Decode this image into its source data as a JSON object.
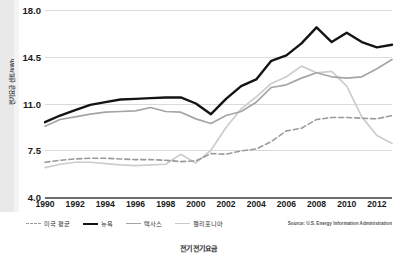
{
  "chart_data": {
    "type": "line",
    "title": "",
    "xlabel": "",
    "ylabel": "전기요금 센트/kWh",
    "ylim": [
      4.0,
      18.0
    ],
    "xlim": [
      1990,
      2013
    ],
    "yticks": [
      "18.0",
      "14.5",
      "11.0",
      "7.5",
      "4.0"
    ],
    "ytick_values": [
      18.0,
      14.5,
      11.0,
      7.5,
      4.0
    ],
    "xticks": [
      "1990",
      "1992",
      "1994",
      "1996",
      "1998",
      "2000",
      "2002",
      "2004",
      "2006",
      "2008",
      "2010",
      "2012"
    ],
    "xtick_values": [
      1990,
      1992,
      1994,
      1996,
      1998,
      2000,
      2002,
      2004,
      2006,
      2008,
      2010,
      2012
    ],
    "x": [
      1990,
      1991,
      1992,
      1993,
      1994,
      1995,
      1996,
      1997,
      1998,
      1999,
      2000,
      2001,
      2002,
      2003,
      2004,
      2005,
      2006,
      2007,
      2008,
      2009,
      2010,
      2011,
      2012,
      2013
    ],
    "grid": true,
    "legend_position": "bottom",
    "series": [
      {
        "name": "미국 평균",
        "style": "dashed",
        "color": "#9a9a9a",
        "width": 1.6,
        "values": [
          6.6,
          6.75,
          6.85,
          6.9,
          6.9,
          6.85,
          6.8,
          6.8,
          6.75,
          6.65,
          6.7,
          7.25,
          7.2,
          7.45,
          7.6,
          8.15,
          8.95,
          9.15,
          9.8,
          9.95,
          9.95,
          9.9,
          9.85,
          10.1
        ]
      },
      {
        "name": "뉴욕",
        "style": "solid",
        "color": "#141414",
        "width": 2.4,
        "values": [
          9.6,
          10.1,
          10.5,
          10.9,
          11.1,
          11.3,
          11.35,
          11.4,
          11.45,
          11.45,
          11.0,
          10.2,
          11.35,
          12.3,
          12.8,
          14.2,
          14.6,
          15.5,
          16.7,
          15.6,
          16.3,
          15.6,
          15.2,
          15.4
        ]
      },
      {
        "name": "텍사스",
        "style": "solid",
        "color": "#a5a5a5",
        "width": 1.7,
        "values": [
          9.3,
          9.8,
          10.0,
          10.2,
          10.35,
          10.4,
          10.45,
          10.7,
          10.4,
          10.35,
          9.85,
          9.5,
          10.1,
          10.4,
          11.1,
          12.2,
          12.4,
          12.9,
          13.3,
          13.0,
          12.9,
          13.0,
          13.6,
          14.3
        ]
      },
      {
        "name": "캘리포니아",
        "style": "solid",
        "color": "#cdcdcd",
        "width": 1.7,
        "values": [
          6.2,
          6.45,
          6.6,
          6.6,
          6.5,
          6.4,
          6.35,
          6.4,
          6.45,
          7.2,
          6.55,
          7.5,
          9.2,
          10.6,
          11.5,
          12.5,
          13.0,
          13.8,
          13.3,
          13.4,
          12.3,
          10.0,
          8.6,
          8.0
        ]
      }
    ]
  },
  "legend": {
    "items": [
      {
        "label": "미국 평균",
        "swatch": "dashed-gray"
      },
      {
        "label": "뉴욕",
        "swatch": "solid-black"
      },
      {
        "label": "텍사스",
        "swatch": "solid-gray"
      },
      {
        "label": "캘리포니아",
        "swatch": "solid-lightgray"
      }
    ]
  },
  "source_note": "Source: U.S. Energy Information Administration",
  "caption": "전기 전기요금",
  "colors": {
    "grid": "#dadada",
    "axis": "#6e6e6e",
    "text": "#1a1a1a",
    "edge_strip": "#e9e9e9"
  }
}
